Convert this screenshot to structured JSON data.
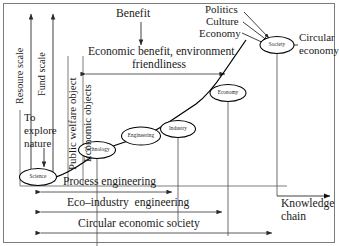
{
  "figure": {
    "type": "diagram"
  },
  "axes": {
    "vertical_left": {
      "label": "Resoure scale",
      "arrow": "double"
    },
    "vertical_inner": {
      "label": "Fund scale",
      "arrow": "double"
    },
    "horizontal_bottom": {
      "label_line1": "Knowledge",
      "label_line2": "chain",
      "arrow": "single-right"
    }
  },
  "vertical_bands": [
    {
      "label": "Public welfare object"
    },
    {
      "label": "Economic objects"
    }
  ],
  "annotations": {
    "explore": {
      "line1": "To",
      "line2": "explore",
      "line3": "nature"
    },
    "benefit": {
      "label": "Benefit"
    },
    "economic_benefit": {
      "line1": "Economic benefit, environment",
      "line2": "friendliness"
    },
    "circular_economy": {
      "line1": "Circular",
      "line2": "economy"
    },
    "society_drivers": [
      "Politics",
      "Culture",
      "Economy"
    ]
  },
  "nodes": [
    {
      "id": "science",
      "label": "Science"
    },
    {
      "id": "technology",
      "label": "Technology"
    },
    {
      "id": "engineering",
      "label": "Engineering"
    },
    {
      "id": "industry",
      "label": "Industry"
    },
    {
      "id": "economy",
      "label": "Economy"
    },
    {
      "id": "society",
      "label": "Society"
    }
  ],
  "spans": [
    {
      "id": "process-engineering",
      "label": "Process engineering"
    },
    {
      "id": "eco-industry",
      "label": "Eco–industry  engineering"
    },
    {
      "id": "circular-society",
      "label": "Circular economic society"
    }
  ]
}
